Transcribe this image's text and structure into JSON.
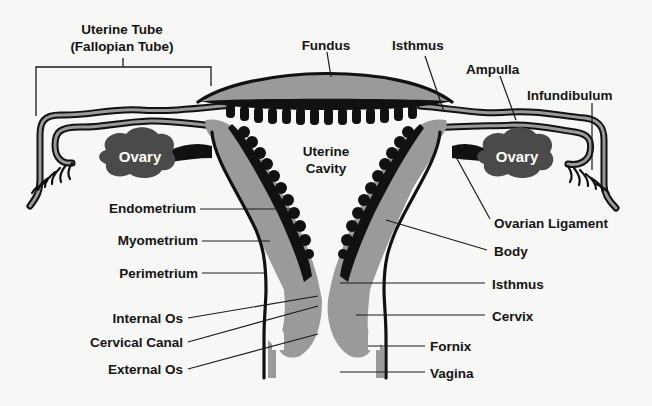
{
  "diagram": {
    "title_hidden": "",
    "labels": {
      "uterine_tube_line1": "Uterine Tube",
      "uterine_tube_line2": "(Fallopian Tube)",
      "fundus": "Fundus",
      "isthmus_tube": "Isthmus",
      "ampulla": "Ampulla",
      "infundibulum": "Infundibulum",
      "ovary_left": "Ovary",
      "ovary_right": "Ovary",
      "uterine_cavity_line1": "Uterine",
      "uterine_cavity_line2": "Cavity",
      "endometrium": "Endometrium",
      "myometrium": "Myometrium",
      "perimetrium": "Perimetrium",
      "internal_os": "Internal Os",
      "cervical_canal": "Cervical Canal",
      "external_os": "External Os",
      "ovarian_ligament": "Ovarian Ligament",
      "body": "Body",
      "isthmus_uterus": "Isthmus",
      "cervix": "Cervix",
      "fornix": "Fornix",
      "vagina": "Vagina"
    },
    "colors": {
      "background": "#f7f7f5",
      "tissue": "#9a9a9a",
      "endometrium": "#111111",
      "ovary": "#4a4a4a",
      "text": "#141414"
    }
  }
}
